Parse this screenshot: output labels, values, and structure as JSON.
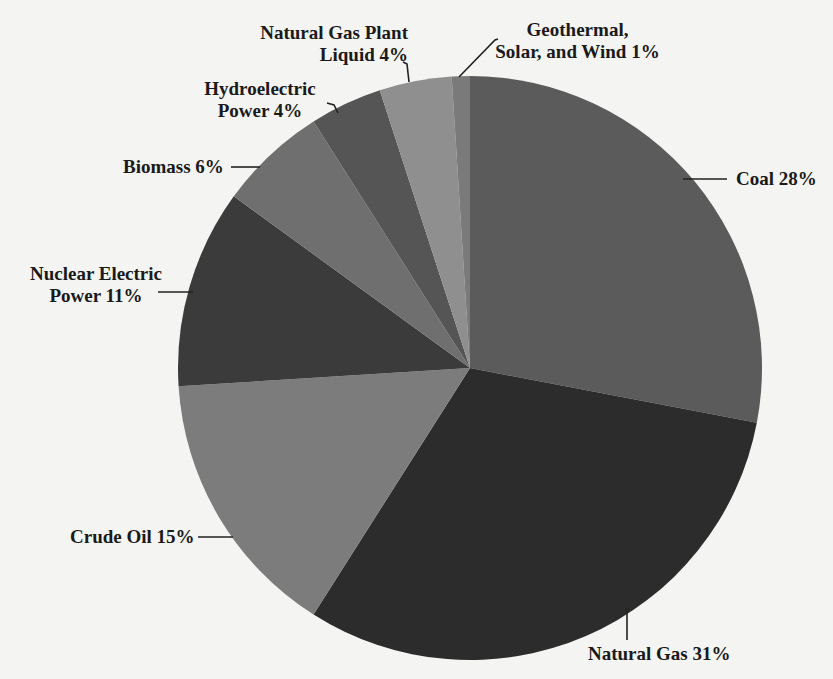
{
  "chart_data": {
    "type": "pie",
    "title": "",
    "start_angle_deg": 0,
    "direction": "clockwise",
    "center": [
      470,
      368
    ],
    "radius": 292,
    "slices": [
      {
        "name": "Coal",
        "value": 28,
        "label": "Coal 28%",
        "color": "#5b5b5b"
      },
      {
        "name": "Natural Gas",
        "value": 31,
        "label": "Natural Gas 31%",
        "color": "#2c2c2c"
      },
      {
        "name": "Crude Oil",
        "value": 15,
        "label": "Crude Oil 15%",
        "color": "#7c7c7c"
      },
      {
        "name": "Nuclear Electric Power",
        "value": 11,
        "label": "Nuclear Electric Power 11%",
        "color": "#3b3b3b"
      },
      {
        "name": "Biomass",
        "value": 6,
        "label": "Biomass 6%",
        "color": "#6f6f6f"
      },
      {
        "name": "Hydroelectric Power",
        "value": 4,
        "label": "Hydroelectric Power 4%",
        "color": "#555555"
      },
      {
        "name": "Natural Gas Plant Liquid",
        "value": 4,
        "label": "Natural Gas Plant Liquid 4%",
        "color": "#8f8f8f"
      },
      {
        "name": "Geothermal, Solar, and Wind",
        "value": 1,
        "label": "Geothermal, Solar, and Wind 1%",
        "color": "#7a7a7a"
      }
    ]
  },
  "labels": {
    "coal": "Coal 28%",
    "natural_gas": "Natural Gas 31%",
    "crude_oil": "Crude Oil 15%",
    "nuclear_line1": "Nuclear Electric",
    "nuclear_line2": "Power 11%",
    "biomass": "Biomass 6%",
    "hydro_line1": "Hydroelectric",
    "hydro_line2": "Power 4%",
    "ngpl_line1": "Natural Gas Plant",
    "ngpl_line2": "Liquid 4%",
    "geo_line1": "Geothermal,",
    "geo_line2": "Solar, and Wind 1%"
  }
}
